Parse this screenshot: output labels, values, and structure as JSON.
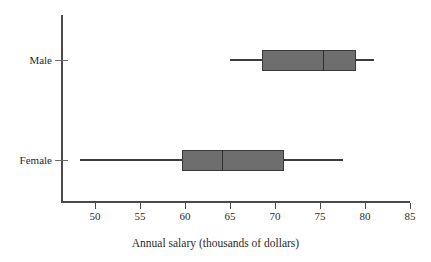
{
  "chart_data": {
    "type": "box",
    "title": "",
    "xlabel": "Annual salary (thousands of dollars)",
    "ylabel": "",
    "orientation": "horizontal",
    "xlim": [
      46,
      86.5
    ],
    "xticks": [
      50,
      55,
      60,
      65,
      70,
      75,
      80,
      85
    ],
    "xtick_labels": [
      "50",
      "55",
      "60",
      "65",
      "70",
      "75",
      "80",
      "85"
    ],
    "grid": false,
    "legend": "none",
    "categories": [
      "Male",
      "Female"
    ],
    "boxes": [
      {
        "label": "Male",
        "min": 65,
        "q1": 68.5,
        "median": 75.3,
        "q3": 79,
        "max": 81
      },
      {
        "label": "Female",
        "min": 48.3,
        "q1": 59.7,
        "median": 64.1,
        "q3": 71,
        "max": 77.5
      }
    ],
    "colors": {
      "box_fill": "#6e6e6e",
      "box_border": "#3a3a3a",
      "whisker": "#3c3c3c",
      "median": "#2e2e2e",
      "axis": "#4a4a4a",
      "text": "#2b2b2b",
      "background": "#ffffff"
    }
  }
}
